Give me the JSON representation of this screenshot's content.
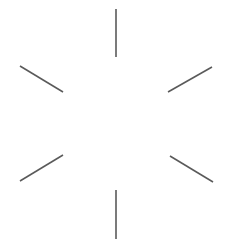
{
  "figure": {
    "title": "Radial spoke figure",
    "canvas": {
      "width": 231,
      "height": 239,
      "background_color": "#ffffff"
    },
    "style": {
      "stroke_color": "#5a5a5a",
      "stroke_width": 1.6,
      "line_cap": "butt"
    },
    "center": {
      "x": 116,
      "y": 124
    },
    "spoke_count": 6,
    "spokes": [
      {
        "name": "top-vertical-spoke",
        "angle_deg": 90,
        "x1": 116,
        "y1": 9,
        "x2": 116,
        "y2": 57,
        "length": 48
      },
      {
        "name": "upper-right-diagonal-spoke",
        "angle_deg": 30,
        "x1": 212,
        "y1": 67,
        "x2": 168,
        "y2": 92,
        "length": 50.6
      },
      {
        "name": "lower-right-diagonal-spoke",
        "angle_deg": 330,
        "x1": 170,
        "y1": 156,
        "x2": 213,
        "y2": 182,
        "length": 50.2
      },
      {
        "name": "bottom-vertical-spoke",
        "angle_deg": 270,
        "x1": 116,
        "y1": 190,
        "x2": 116,
        "y2": 239,
        "length": 49
      },
      {
        "name": "lower-left-diagonal-spoke",
        "angle_deg": 210,
        "x1": 63,
        "y1": 155,
        "x2": 20,
        "y2": 181,
        "length": 50.3
      },
      {
        "name": "upper-left-diagonal-spoke",
        "angle_deg": 150,
        "x1": 20,
        "y1": 66,
        "x2": 63,
        "y2": 92,
        "length": 50.2
      }
    ]
  }
}
